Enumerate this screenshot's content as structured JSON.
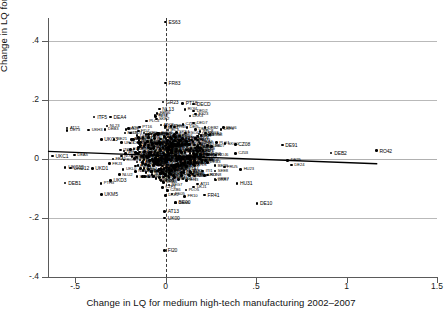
{
  "chart_data": {
    "type": "scatter",
    "title": "",
    "xlabel": "Change in LQ for medium high-tech manufacturing 2002–2007",
    "ylabel": "Change in LQ for KIS 2002–2007",
    "xlim": [
      -0.65,
      1.5
    ],
    "ylim": [
      -0.4,
      0.47
    ],
    "xticks": [
      "-.5",
      "0",
      ".5",
      "1",
      "1.5"
    ],
    "xtick_values": [
      -0.5,
      0,
      0.5,
      1,
      1.5
    ],
    "yticks": [
      ".4",
      ".2",
      "0",
      "-.2",
      "-.4"
    ],
    "ytick_values": [
      0.4,
      0.2,
      0,
      -0.2,
      -0.4
    ],
    "grid": "horizontal",
    "legend": "none",
    "reference_line": {
      "type": "vertical-dashed",
      "x": 0
    },
    "fit_line": {
      "type": "linear",
      "x0": -0.65,
      "y0": 0.026,
      "x1": 1.17,
      "y1": -0.016,
      "slope": -0.023
    },
    "points": [
      {
        "label": "ES63",
        "x": 0.0,
        "y": 0.465
      },
      {
        "label": "FR83",
        "x": 0.0,
        "y": 0.258
      },
      {
        "label": "GR23",
        "x": -0.015,
        "y": 0.193
      },
      {
        "label": "PT18",
        "x": 0.095,
        "y": 0.188
      },
      {
        "label": "DECD",
        "x": 0.155,
        "y": 0.186
      },
      {
        "label": "NL13",
        "x": -0.035,
        "y": 0.17
      },
      {
        "label": "DED2",
        "x": 0.155,
        "y": 0.163
      },
      {
        "label": "ES23",
        "x": 0.165,
        "y": 0.152
      },
      {
        "label": "ITF5",
        "x": -0.395,
        "y": 0.143
      },
      {
        "label": "DEA4",
        "x": -0.305,
        "y": 0.143
      },
      {
        "label": "NL32",
        "x": -0.055,
        "y": 0.145
      },
      {
        "label": "DED7",
        "x": 0.155,
        "y": 0.122
      },
      {
        "label": "NL23",
        "x": -0.325,
        "y": 0.112
      },
      {
        "label": "AT12",
        "x": -0.545,
        "y": 0.105
      },
      {
        "label": "DE73",
        "x": -0.545,
        "y": 0.097
      },
      {
        "label": "UKH3",
        "x": -0.425,
        "y": 0.098
      },
      {
        "label": "DEB3",
        "x": -0.335,
        "y": 0.1
      },
      {
        "label": "PT16",
        "x": -0.145,
        "y": 0.108
      },
      {
        "label": "DE92",
        "x": 0.165,
        "y": 0.101
      },
      {
        "label": "ITD3",
        "x": -0.195,
        "y": 0.088
      },
      {
        "label": "DE13",
        "x": 0.185,
        "y": 0.085
      },
      {
        "label": "ITE2",
        "x": 0.245,
        "y": 0.083
      },
      {
        "label": "UKG3",
        "x": -0.355,
        "y": 0.067
      },
      {
        "label": "BE21",
        "x": -0.285,
        "y": 0.066
      },
      {
        "label": "UKJ3",
        "x": -0.245,
        "y": 0.055
      },
      {
        "label": "DEA2",
        "x": 0.185,
        "y": 0.058
      },
      {
        "label": "CZ08",
        "x": 0.385,
        "y": 0.05
      },
      {
        "label": "DE91",
        "x": 0.645,
        "y": 0.047
      },
      {
        "label": "DE27",
        "x": 0.255,
        "y": 0.042
      },
      {
        "label": "CZ03",
        "x": 0.385,
        "y": 0.018
      },
      {
        "label": "DEB2",
        "x": 0.915,
        "y": 0.02
      },
      {
        "label": "RO42",
        "x": 1.165,
        "y": 0.028
      },
      {
        "label": "UKC1",
        "x": -0.625,
        "y": 0.01
      },
      {
        "label": "DEA5",
        "x": -0.505,
        "y": 0.013
      },
      {
        "label": "DE25",
        "x": 0.675,
        "y": -0.005
      },
      {
        "label": "DE24",
        "x": 0.695,
        "y": -0.02
      },
      {
        "label": "UKC12",
        "x": -0.555,
        "y": -0.028
      },
      {
        "label": "UKD12",
        "x": -0.525,
        "y": -0.03
      },
      {
        "label": "UKD1",
        "x": -0.405,
        "y": -0.032
      },
      {
        "label": "HU23",
        "x": 0.415,
        "y": -0.035
      },
      {
        "label": "UKL0",
        "x": -0.235,
        "y": -0.035
      },
      {
        "label": "ITI1",
        "x": 0.205,
        "y": -0.04
      },
      {
        "label": "UKI3",
        "x": 0.215,
        "y": -0.055
      },
      {
        "label": "UKD3",
        "x": -0.305,
        "y": -0.073
      },
      {
        "label": "DEB1",
        "x": -0.555,
        "y": -0.082
      },
      {
        "label": "HU31",
        "x": 0.395,
        "y": -0.083
      },
      {
        "label": "AT11",
        "x": 0.175,
        "y": -0.085
      },
      {
        "label": "UKJ1",
        "x": 0.155,
        "y": -0.095
      },
      {
        "label": "UKM5",
        "x": -0.355,
        "y": -0.12
      },
      {
        "label": "FR41",
        "x": 0.215,
        "y": -0.122
      },
      {
        "label": "FR10",
        "x": 0.105,
        "y": -0.127
      },
      {
        "label": "ES05",
        "x": 0.035,
        "y": -0.118
      },
      {
        "label": "BE00",
        "x": 0.055,
        "y": -0.147
      },
      {
        "label": "DE10",
        "x": 0.505,
        "y": -0.15
      },
      {
        "label": "AT13",
        "x": -0.005,
        "y": -0.178
      },
      {
        "label": "UK00",
        "x": -0.005,
        "y": -0.2
      },
      {
        "label": "FI20",
        "x": -0.005,
        "y": -0.31
      }
    ]
  }
}
